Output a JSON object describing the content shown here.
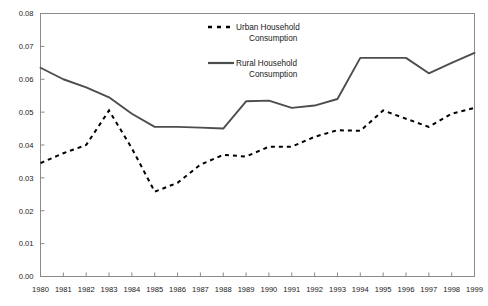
{
  "chart_data": {
    "type": "line",
    "title": "",
    "xlabel": "",
    "ylabel": "",
    "x": [
      1980,
      1981,
      1982,
      1983,
      1984,
      1985,
      1986,
      1987,
      1988,
      1989,
      1990,
      1991,
      1992,
      1993,
      1994,
      1995,
      1996,
      1997,
      1998,
      1999
    ],
    "xtick_labels": [
      "1980",
      "1981",
      "1982",
      "1983",
      "1984",
      "1985",
      "1986",
      "1987",
      "1988",
      "1989",
      "1990",
      "1991",
      "1992",
      "1993",
      "1994",
      "1995",
      "1996",
      "1997",
      "1998",
      "1999"
    ],
    "ytick_labels": [
      "0.00",
      "0.01",
      "0.02",
      "0.03",
      "0.04",
      "0.05",
      "0.06",
      "0.07",
      "0.08"
    ],
    "ytick_values": [
      0.0,
      0.01,
      0.02,
      0.03,
      0.04,
      0.05,
      0.06,
      0.07,
      0.08
    ],
    "ylim": [
      0.0,
      0.08
    ],
    "xlim": [
      1980,
      1999
    ],
    "grid": false,
    "legend_position": "top-center",
    "series": [
      {
        "name": "Urban Household Consumption",
        "style": "dashed",
        "color": "#000000",
        "values": [
          0.0345,
          0.0375,
          0.04,
          0.0505,
          0.039,
          0.0258,
          0.0285,
          0.034,
          0.037,
          0.0365,
          0.0395,
          0.0395,
          0.0425,
          0.0445,
          0.0443,
          0.0505,
          0.048,
          0.0455,
          0.0495,
          0.0513
        ]
      },
      {
        "name": "Rural Household Consumption",
        "style": "solid",
        "color": "#4d4d4d",
        "values": [
          0.0635,
          0.06,
          0.0575,
          0.0545,
          0.0495,
          0.0455,
          0.0455,
          0.0453,
          0.045,
          0.0533,
          0.0535,
          0.0513,
          0.052,
          0.054,
          0.0665,
          0.0665,
          0.0665,
          0.0618,
          0.065,
          0.068
        ]
      }
    ],
    "legend": [
      {
        "label_line1": "Urban  Household",
        "label_line2": "Consumption",
        "style": "dashed"
      },
      {
        "label_line1": "Rural  Household",
        "label_line2": "Consumption",
        "style": "solid"
      }
    ]
  }
}
